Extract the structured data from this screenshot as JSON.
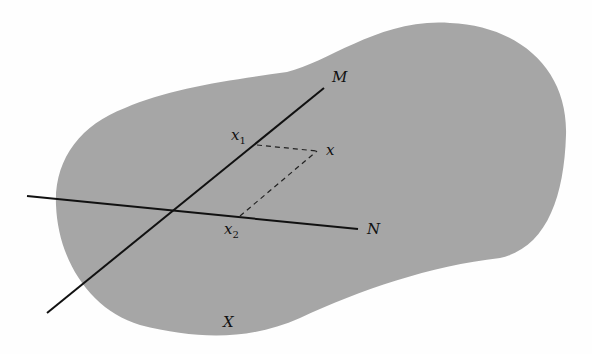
{
  "diagram": {
    "region_label": "X",
    "line_m_label": "M",
    "line_n_label": "N",
    "point_x_label": "x",
    "point_x1_base": "x",
    "point_x1_sub": "1",
    "point_x2_base": "x",
    "point_x2_sub": "2"
  },
  "colors": {
    "region_fill": "#a6a6a6",
    "line": "#111111",
    "background": "#fefefe"
  }
}
